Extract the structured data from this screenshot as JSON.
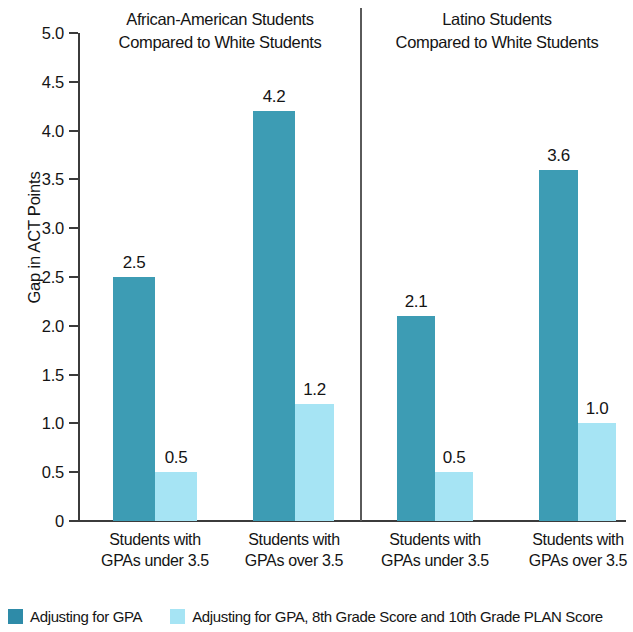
{
  "chart_data": {
    "type": "bar",
    "title": "",
    "xlabel": "",
    "ylabel": "Gap in ACT Points",
    "ylim": [
      0,
      5.0
    ],
    "ytick_labels": [
      "5.0",
      "4.5",
      "4.0",
      "3.5",
      "3.0",
      "2.5",
      "2.0",
      "1.5",
      "1.0",
      "0.5",
      "0"
    ],
    "ytick_values": [
      5.0,
      4.5,
      4.0,
      3.5,
      3.0,
      2.5,
      2.0,
      1.5,
      1.0,
      0.5,
      0
    ],
    "grid": false,
    "legend_position": "bottom-left",
    "panels": [
      {
        "title_lines": [
          "African-American Students",
          "Compared to White Students"
        ],
        "categories": [
          "Students with GPAs under 3.5",
          "Students with GPAs over 3.5"
        ]
      },
      {
        "title_lines": [
          "Latino Students",
          "Compared to White Students"
        ],
        "categories": [
          "Students with GPAs under 3.5",
          "Students with GPAs over 3.5"
        ]
      }
    ],
    "categories": [
      "Students with GPAs under 3.5",
      "Students with GPAs over 3.5",
      "Students with GPAs under 3.5",
      "Students with GPAs over 3.5"
    ],
    "series": [
      {
        "name": "Adjusting for GPA",
        "color": "#3d9cb4",
        "values": [
          2.5,
          4.2,
          2.1,
          3.6
        ]
      },
      {
        "name": "Adjusting for GPA, 8th Grade Score and 10th Grade PLAN Score",
        "color": "#a6e4f4",
        "values": [
          0.5,
          1.2,
          0.5,
          1.0
        ]
      }
    ],
    "data_labels": [
      "2.5",
      "0.5",
      "4.2",
      "1.2",
      "2.1",
      "0.5",
      "3.6",
      "1.0"
    ]
  },
  "axis": {
    "y_title": "Gap in ACT Points",
    "ticks": [
      {
        "label": "5.0",
        "value": 5.0
      },
      {
        "label": "4.5",
        "value": 4.5
      },
      {
        "label": "4.0",
        "value": 4.0
      },
      {
        "label": "3.5",
        "value": 3.5
      },
      {
        "label": "3.0",
        "value": 3.0
      },
      {
        "label": "2.5",
        "value": 2.5
      },
      {
        "label": "2.0",
        "value": 2.0
      },
      {
        "label": "1.5",
        "value": 1.5
      },
      {
        "label": "1.0",
        "value": 1.0
      },
      {
        "label": "0.5",
        "value": 0.5
      },
      {
        "label": "0",
        "value": 0
      }
    ]
  },
  "panels": [
    {
      "title_line_1": "African-American Students",
      "title_line_2": "Compared to White Students"
    },
    {
      "title_line_1": "Latino Students",
      "title_line_2": "Compared to White Students"
    }
  ],
  "x_categories": [
    {
      "line_1": "Students with",
      "line_2": "GPAs under 3.5"
    },
    {
      "line_1": "Students with",
      "line_2": "GPAs over 3.5"
    },
    {
      "line_1": "Students with",
      "line_2": "GPAs under 3.5"
    },
    {
      "line_1": "Students with",
      "line_2": "GPAs over 3.5"
    }
  ],
  "bars": [
    {
      "value": 2.5,
      "label": "2.5",
      "series": "Adjusting for GPA"
    },
    {
      "value": 0.5,
      "label": "0.5",
      "series": "Adjusting for GPA, 8th Grade Score and 10th Grade PLAN Score"
    },
    {
      "value": 4.2,
      "label": "4.2",
      "series": "Adjusting for GPA"
    },
    {
      "value": 1.2,
      "label": "1.2",
      "series": "Adjusting for GPA, 8th Grade Score and 10th Grade PLAN Score"
    },
    {
      "value": 2.1,
      "label": "2.1",
      "series": "Adjusting for GPA"
    },
    {
      "value": 0.5,
      "label": "0.5",
      "series": "Adjusting for GPA, 8th Grade Score and 10th Grade PLAN Score"
    },
    {
      "value": 3.6,
      "label": "3.6",
      "series": "Adjusting for GPA"
    },
    {
      "value": 1.0,
      "label": "1.0",
      "series": "Adjusting for GPA, 8th Grade Score and 10th Grade PLAN Score"
    }
  ],
  "legend": {
    "items": [
      {
        "label": "Adjusting for GPA",
        "color": "#2e8ba8"
      },
      {
        "label": "Adjusting for GPA, 8th Grade Score and 10th Grade PLAN Score",
        "color": "#a6e4f4"
      }
    ]
  },
  "colors": {
    "series_dark": "#3d9cb4",
    "series_light": "#a6e4f4",
    "axis": "#3b3b3b",
    "text": "#141414",
    "background": "#ffffff"
  }
}
